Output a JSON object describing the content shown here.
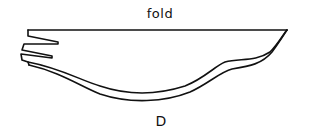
{
  "diagram": {
    "fold_label": "fold",
    "piece_label": "D",
    "line_color": "#111111",
    "background": "#ffffff"
  }
}
